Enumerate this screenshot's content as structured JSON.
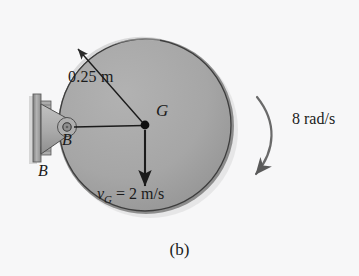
{
  "figure": {
    "caption": "(b)",
    "background_color": "#f7f7f8",
    "ink_color": "#1b1b1b"
  },
  "disk": {
    "name": "rotating-disk",
    "fill_color": "#a5a5a5",
    "rim_color": "#8b8b8b",
    "edge_color": "#3a3a3a",
    "center_x": 145,
    "center_y": 125,
    "radius_px": 88
  },
  "dimensions": {
    "radius_label": "0.25 m"
  },
  "points": {
    "center_label": "G",
    "pin_label_inner": "B",
    "pin_label_outer": "B"
  },
  "velocity": {
    "symbol": "v",
    "subscript": "G",
    "equals": "=",
    "value": "2 m/s",
    "full_label": "vG = 2 m/s",
    "direction": "down"
  },
  "angular_velocity": {
    "label": "8 rad/s",
    "value": 8,
    "units": "rad/s",
    "direction": "clockwise"
  },
  "support": {
    "name": "wall-bracket-pin-support",
    "plate_color": "#9a9a9a",
    "bracket_color": "#b0b0b0",
    "bolt_count": 2
  }
}
